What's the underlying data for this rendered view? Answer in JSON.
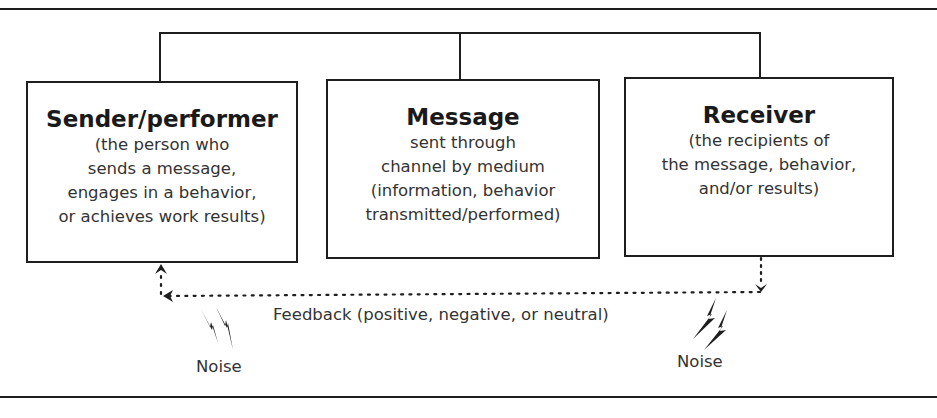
{
  "diagram": {
    "nodes": [
      {
        "id": "sender",
        "title": "Sender/performer",
        "description": "(the person who\nsends a message,\nengages in a behavior,\nor achieves work results)"
      },
      {
        "id": "message",
        "title": "Message",
        "description": "sent through\nchannel by medium\n(information, behavior\ntransmitted/performed)"
      },
      {
        "id": "receiver",
        "title": "Receiver",
        "description": "(the recipients of\nthe message, behavior,\nand/or results)"
      }
    ],
    "feedback": {
      "label": "Feedback (positive, negative, or neutral)",
      "from": "receiver",
      "to": "sender",
      "style": "dotted"
    },
    "noise": [
      {
        "label": "Noise",
        "position": "left",
        "icon": "lightning-bolt-icon"
      },
      {
        "label": "Noise",
        "position": "right",
        "icon": "lightning-bolt-icon"
      }
    ],
    "colors": {
      "line": "#1e1e1e",
      "text": "#333333",
      "background": "#ffffff"
    }
  }
}
